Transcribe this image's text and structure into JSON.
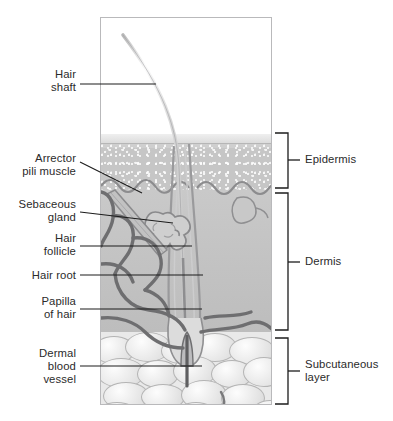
{
  "diagram": {
    "frame": {
      "x": 100,
      "y": 17,
      "width": 172,
      "height": 388
    }
  },
  "left_labels": [
    {
      "name": "hair-shaft",
      "text": "Hair\nshaft",
      "top": 68,
      "leader": {
        "x1": 80,
        "y1": 84,
        "x2": 156,
        "y2": 84
      }
    },
    {
      "name": "arrector-pili-muscle",
      "text": "Arrector\npili muscle",
      "top": 152,
      "leader": {
        "x1": 80,
        "y1": 162,
        "x2": 140,
        "y2": 192
      }
    },
    {
      "name": "sebaceous-gland",
      "text": "Sebaceous\ngland",
      "top": 198,
      "leader": {
        "x1": 80,
        "y1": 212,
        "x2": 172,
        "y2": 222
      }
    },
    {
      "name": "hair-follicle",
      "text": "Hair\nfollicle",
      "top": 232,
      "leader": {
        "x1": 80,
        "y1": 246,
        "x2": 192,
        "y2": 246
      }
    },
    {
      "name": "hair-root",
      "text": "Hair root",
      "top": 269,
      "leader": {
        "x1": 80,
        "y1": 275,
        "x2": 203,
        "y2": 275
      }
    },
    {
      "name": "papilla-of-hair",
      "text": "Papilla\nof hair",
      "top": 295,
      "leader": {
        "x1": 80,
        "y1": 309,
        "x2": 202,
        "y2": 309
      }
    },
    {
      "name": "dermal-blood-vessel",
      "text": "Dermal\nblood\nvessel",
      "top": 347,
      "leader": {
        "x1": 80,
        "y1": 366,
        "x2": 202,
        "y2": 366
      }
    }
  ],
  "layer_brackets": [
    {
      "name": "epidermis",
      "text": "Epidermis",
      "top": 133,
      "bottom": 188,
      "tick_y": 160
    },
    {
      "name": "dermis",
      "text": "Dermis",
      "top": 193,
      "bottom": 330,
      "tick_y": 262
    },
    {
      "name": "subcutaneous-layer",
      "text": "Subcutaneous\nlayer",
      "top": 338,
      "bottom": 404,
      "tick_y": 371
    }
  ],
  "colors": {
    "ink": "#231f20",
    "line": "#1c1c1c",
    "frame_border": "#b9b9bb",
    "epidermis": "#cfcfcf",
    "dermis": "#c4c4c4",
    "subcutaneous": "#e9e9e9",
    "vessel": "#6e6e70",
    "background": "#ffffff"
  }
}
